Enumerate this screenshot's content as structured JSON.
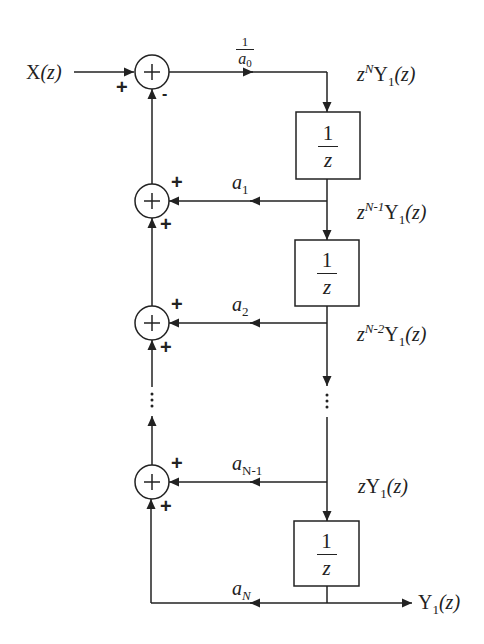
{
  "diagram": {
    "input": {
      "label": "X(z)",
      "base": "X",
      "arg": "(z)"
    },
    "output": {
      "label": "Y1(z)",
      "base": "Y",
      "sub": "1",
      "arg": "(z)"
    },
    "colors": {
      "stroke": "#222222",
      "background": "#ffffff"
    },
    "input_gain": {
      "num": "1",
      "den_base": "a",
      "den_sub": "0",
      "label": "1/a0"
    },
    "summers": [
      {
        "id": "sum0",
        "symbol": "+",
        "left_sign": "+",
        "bottom_sign": "-"
      },
      {
        "id": "sum1",
        "symbol": "+",
        "right_sign": "+",
        "bottom_sign": "+"
      },
      {
        "id": "sum2",
        "symbol": "+",
        "right_sign": "+",
        "bottom_sign": "+"
      },
      {
        "id": "sum3",
        "symbol": "+",
        "right_sign": "+",
        "bottom_sign": "+"
      }
    ],
    "delays": [
      {
        "id": "delay1",
        "num": "1",
        "den": "z",
        "label": "1/z"
      },
      {
        "id": "delay2",
        "num": "1",
        "den": "z",
        "label": "1/z"
      },
      {
        "id": "delay3",
        "num": "1",
        "den": "z",
        "label": "1/z"
      }
    ],
    "coefficients": [
      {
        "base": "a",
        "sub": "1",
        "label": "a1"
      },
      {
        "base": "a",
        "sub": "2",
        "label": "a2"
      },
      {
        "base": "a",
        "sub": "N-1",
        "label": "aN-1"
      },
      {
        "base": "a",
        "sub": "N",
        "label": "aN"
      }
    ],
    "node_signals": [
      {
        "pre": "z",
        "sup": "N",
        "base": "Y",
        "sub": "1",
        "arg": "(z)",
        "label": "z^N Y1(z)"
      },
      {
        "pre": "z",
        "sup": "N-1",
        "base": "Y",
        "sub": "1",
        "arg": "(z)",
        "label": "z^(N-1) Y1(z)"
      },
      {
        "pre": "z",
        "sup": "N-2",
        "base": "Y",
        "sub": "1",
        "arg": "(z)",
        "label": "z^(N-2) Y1(z)"
      },
      {
        "pre": "z",
        "sup": "",
        "base": "Y",
        "sub": "1",
        "arg": "(z)",
        "label": "z Y1(z)"
      }
    ],
    "ellipsis": "⋮"
  }
}
